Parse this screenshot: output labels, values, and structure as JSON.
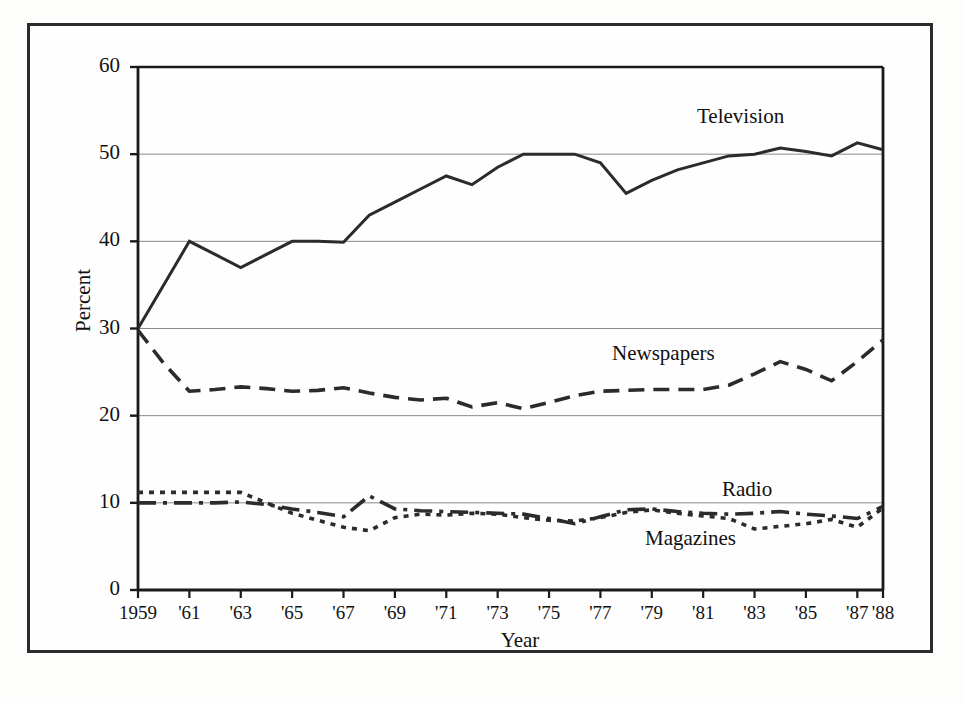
{
  "figure": {
    "ylabel": "Percent",
    "xlabel": "Year"
  },
  "labels": {
    "television": "Television",
    "newspapers": "Newspapers",
    "radio": "Radio",
    "magazines": "Magazines"
  },
  "yticks": [
    "0",
    "10",
    "20",
    "30",
    "40",
    "50",
    "60"
  ],
  "xticks": [
    "1959",
    "'61",
    "'63",
    "'65",
    "'67",
    "'69",
    "'71",
    "'73",
    "'75",
    "'77",
    "'79",
    "'81",
    "'83",
    "'85",
    "'87",
    "'88"
  ],
  "colors": {
    "line": "#2b2b2b",
    "grid": "#8a8a8a",
    "axis": "#1a1a1a",
    "frame": "#2b2b2b",
    "background": "#fefefe"
  },
  "chart_data": {
    "type": "line",
    "title": "",
    "xlabel": "Year",
    "ylabel": "Percent",
    "xlim": [
      1959,
      1988
    ],
    "ylim": [
      0,
      60
    ],
    "yticks": [
      0,
      10,
      20,
      30,
      40,
      50,
      60
    ],
    "xtick_values": [
      1959,
      1961,
      1963,
      1965,
      1967,
      1969,
      1971,
      1973,
      1975,
      1977,
      1979,
      1981,
      1983,
      1985,
      1987,
      1988
    ],
    "xtick_labels": [
      "1959",
      "'61",
      "'63",
      "'65",
      "'67",
      "'69",
      "'71",
      "'73",
      "'75",
      "'77",
      "'79",
      "'81",
      "'83",
      "'85",
      "'87",
      "'88"
    ],
    "grid": "horizontal",
    "legend": "inline-annotations",
    "x": [
      1959,
      1960,
      1961,
      1962,
      1963,
      1964,
      1965,
      1966,
      1967,
      1968,
      1969,
      1970,
      1971,
      1972,
      1973,
      1974,
      1975,
      1976,
      1977,
      1978,
      1979,
      1980,
      1981,
      1982,
      1983,
      1984,
      1985,
      1986,
      1987,
      1988
    ],
    "series": [
      {
        "name": "Television",
        "style": "solid",
        "values": [
          30.0,
          35.0,
          40.0,
          38.5,
          37.0,
          38.5,
          40.0,
          40.0,
          39.9,
          43.0,
          44.5,
          46.0,
          47.5,
          46.5,
          48.5,
          50.0,
          50.0,
          50.0,
          49.0,
          45.5,
          47.0,
          48.2,
          49.0,
          49.8,
          50.0,
          50.7,
          50.3,
          49.8,
          51.3,
          50.5
        ]
      },
      {
        "name": "Newspapers",
        "style": "dashed",
        "values": [
          29.8,
          26.0,
          22.8,
          23.0,
          23.3,
          23.1,
          22.8,
          22.9,
          23.2,
          22.6,
          22.1,
          21.8,
          22.0,
          21.0,
          21.5,
          20.8,
          21.5,
          22.3,
          22.8,
          22.9,
          23.0,
          23.0,
          23.0,
          23.5,
          24.8,
          26.2,
          25.3,
          24.0,
          26.2,
          28.7
        ]
      },
      {
        "name": "Radio",
        "style": "dashdot",
        "values": [
          10.0,
          10.0,
          10.0,
          10.0,
          10.1,
          9.8,
          9.3,
          8.9,
          8.4,
          10.8,
          9.3,
          9.1,
          9.0,
          8.9,
          8.8,
          8.7,
          8.2,
          7.6,
          8.4,
          9.2,
          9.3,
          9.0,
          8.8,
          8.7,
          8.8,
          9.0,
          8.7,
          8.5,
          8.2,
          9.6
        ]
      },
      {
        "name": "Magazines",
        "style": "dotted",
        "values": [
          11.2,
          11.2,
          11.2,
          11.2,
          11.2,
          10.0,
          8.8,
          8.0,
          7.2,
          6.8,
          8.3,
          8.7,
          8.6,
          8.8,
          8.7,
          8.3,
          8.0,
          7.9,
          8.3,
          8.9,
          9.2,
          8.8,
          8.5,
          8.2,
          7.0,
          7.3,
          7.6,
          8.1,
          7.2,
          9.4
        ]
      }
    ]
  }
}
